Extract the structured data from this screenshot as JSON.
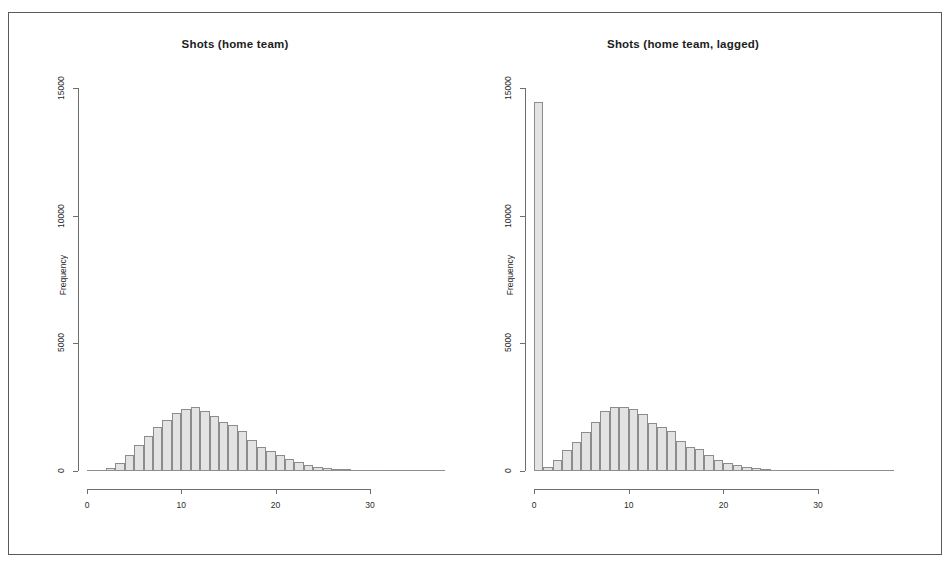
{
  "figure": {
    "background_color": "#ffffff",
    "frame_color": "#5a5a5a",
    "bar_fill_color": "#e3e3e3",
    "bar_border_color": "#8c8c8c",
    "axis_color": "#6e6e6e"
  },
  "chart_data": [
    {
      "type": "bar",
      "panel": "left",
      "title": "Shots (home team)",
      "xlabel": "",
      "ylabel": "Frequency",
      "xlim": [
        0,
        38
      ],
      "ylim": [
        0,
        15000
      ],
      "xticks": [
        0,
        10,
        20,
        30
      ],
      "yticks": [
        0,
        5000,
        10000,
        15000
      ],
      "xtick_labels": [
        "0",
        "10",
        "20",
        "30"
      ],
      "ytick_labels": [
        "0",
        "5000",
        "10000",
        "15000"
      ],
      "grid": false,
      "legend": false,
      "bin_width": 1,
      "bin_starts": [
        0,
        1,
        2,
        3,
        4,
        5,
        6,
        7,
        8,
        9,
        10,
        11,
        12,
        13,
        14,
        15,
        16,
        17,
        18,
        19,
        20,
        21,
        22,
        23,
        24,
        25,
        26,
        27,
        28,
        29,
        30,
        31,
        32,
        33,
        34,
        35,
        36,
        37
      ],
      "values": [
        10,
        40,
        130,
        330,
        640,
        1020,
        1390,
        1720,
        2010,
        2280,
        2430,
        2500,
        2340,
        2160,
        1930,
        1800,
        1580,
        1200,
        960,
        800,
        620,
        470,
        360,
        250,
        170,
        120,
        80,
        50,
        35,
        22,
        14,
        9,
        6,
        4,
        3,
        2,
        1,
        1
      ]
    },
    {
      "type": "bar",
      "panel": "right",
      "title": "Shots (home team, lagged)",
      "xlabel": "",
      "ylabel": "Frequency",
      "xlim": [
        0,
        38
      ],
      "ylim": [
        0,
        15000
      ],
      "xticks": [
        0,
        10,
        20,
        30
      ],
      "yticks": [
        0,
        5000,
        10000,
        15000
      ],
      "xtick_labels": [
        "0",
        "10",
        "20",
        "30"
      ],
      "ytick_labels": [
        "0",
        "5000",
        "10000",
        "15000"
      ],
      "grid": false,
      "legend": false,
      "bin_width": 1,
      "bin_starts": [
        0,
        1,
        2,
        3,
        4,
        5,
        6,
        7,
        8,
        9,
        10,
        11,
        12,
        13,
        14,
        15,
        16,
        17,
        18,
        19,
        20,
        21,
        22,
        23,
        24,
        25,
        26,
        27,
        28,
        29,
        30,
        31,
        32,
        33,
        34,
        35,
        36,
        37
      ],
      "values": [
        14450,
        170,
        430,
        820,
        1130,
        1520,
        1930,
        2350,
        2500,
        2490,
        2430,
        2250,
        1900,
        1740,
        1550,
        1180,
        950,
        850,
        620,
        450,
        320,
        230,
        150,
        110,
        70,
        45,
        30,
        20,
        14,
        9,
        6,
        4,
        3,
        2,
        1,
        1,
        1,
        0
      ]
    }
  ]
}
